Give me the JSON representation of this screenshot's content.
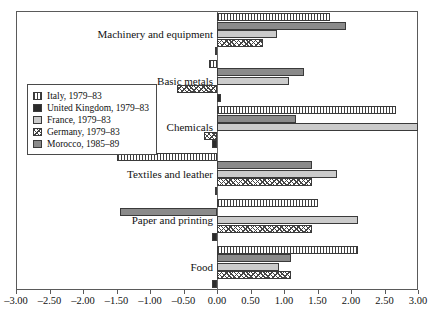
{
  "chart_data": {
    "type": "bar",
    "orientation": "horizontal",
    "title": "",
    "subtitle": "",
    "xlabel": "",
    "ylabel": "",
    "xlim": [
      -3.0,
      3.0
    ],
    "xticks": [
      "-3.00",
      "-2.50",
      "-2.00",
      "-1.50",
      "-1.00",
      "-0.50",
      "0.00",
      "0.50",
      "1.00",
      "1.50",
      "2.00",
      "2.50",
      "3.00"
    ],
    "xtick_values": [
      -3.0,
      -2.5,
      -2.0,
      -1.5,
      -1.0,
      -0.5,
      0.0,
      0.5,
      1.0,
      1.5,
      2.0,
      2.5,
      3.0
    ],
    "grid": false,
    "zero_line": true,
    "legend_position": "left-middle",
    "categories": [
      "Machinery and equipment",
      "Basic metals",
      "Chemicals",
      "Textiles and leather",
      "Paper and printing",
      "Food"
    ],
    "series_draw_order": [
      "Italy",
      "Morocco",
      "France",
      "Germany",
      "United Kingdom"
    ],
    "series": [
      {
        "name": "Italy",
        "label": "Italy, 1979–83",
        "pattern": "vertical-hatch",
        "color": "#ffffff",
        "values": [
          1.68,
          -0.12,
          2.67,
          -1.5,
          1.5,
          2.1
        ]
      },
      {
        "name": "United Kingdom",
        "label": "United Kingdom, 1979–83",
        "pattern": "solid-dark",
        "color": "#2b2b2b",
        "values": [
          -0.03,
          0.06,
          -0.07,
          -0.03,
          -0.08,
          -0.08
        ]
      },
      {
        "name": "France",
        "label": "France, 1979–83",
        "pattern": "solid-light-gray",
        "color": "#cbcbcb",
        "values": [
          0.9,
          1.08,
          3.0,
          1.79,
          2.1,
          0.92
        ]
      },
      {
        "name": "Germany",
        "label": "Germany, 1979–83",
        "pattern": "diagonal-hatch",
        "color": "#ffffff",
        "values": [
          0.68,
          -0.6,
          -0.2,
          1.42,
          1.42,
          1.1
        ]
      },
      {
        "name": "Morocco",
        "label": "Morocco, 1985–89",
        "pattern": "solid-medium-gray",
        "color": "#8a8a8a",
        "values": [
          1.92,
          1.3,
          1.18,
          1.42,
          -1.45,
          1.1
        ]
      }
    ]
  },
  "legend": {
    "items": [
      {
        "label": "Italy, 1979–83"
      },
      {
        "label": "United Kingdom, 1979–83"
      },
      {
        "label": "France, 1979–83"
      },
      {
        "label": "Germany, 1979–83"
      },
      {
        "label": "Morocco, 1985–89"
      }
    ]
  }
}
